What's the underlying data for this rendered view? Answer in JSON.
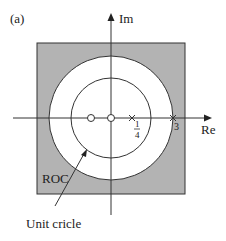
{
  "figure": {
    "panel_label": "(a)",
    "axes": {
      "x_label": "Re",
      "y_label": "Im"
    },
    "region_label": "ROC",
    "annotation": "Unit cricle",
    "pole_labels": {
      "quarter_num": "1",
      "quarter_den": "4",
      "three": "3"
    },
    "colors": {
      "roc_fill": "#b3b3b3",
      "line": "#333333",
      "background": "#ffffff"
    },
    "zeros": [
      {
        "re": -0.33
      },
      {
        "re": 0
      }
    ],
    "poles": [
      {
        "re": 0.25,
        "label": "1/4"
      },
      {
        "re": 3,
        "label": "3"
      }
    ]
  }
}
